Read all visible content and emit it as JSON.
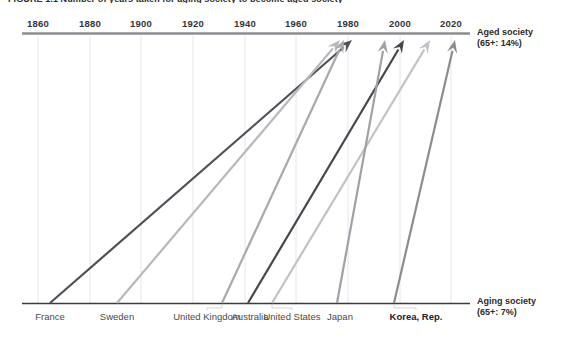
{
  "figure": {
    "title": "FIGURE 1.1 Number of years taken for aging society to become aged society"
  },
  "axis": {
    "top_label_line1": "Aged society",
    "top_label_line2": "(65+: 14%)",
    "bottom_label_line1": "Aging society",
    "bottom_label_line2": "(65+: 7%)",
    "ticks": [
      "1860",
      "1880",
      "1900",
      "1920",
      "1940",
      "1960",
      "1980",
      "2000",
      "2020"
    ],
    "tick_x": [
      38,
      90,
      141,
      193,
      245,
      296,
      348,
      400,
      451
    ]
  },
  "chart_data": {
    "type": "line",
    "title": "Number of years taken for aging society to become aged society",
    "xlabel": "Year",
    "ylabel": "Transition from aging society (65+: 7%) to aged society (65+: 14%)",
    "xlim": [
      1860,
      2030
    ],
    "grid": true,
    "legend": "none",
    "annotations": [
      "Aged society (65+: 14%)",
      "Aging society (65+: 7%)"
    ],
    "series": [
      {
        "name": "France",
        "label": "France",
        "aging_society_year": 1865,
        "aged_society_year": 1980,
        "years_taken": 115,
        "color": "#50505a",
        "x_start_px": 50,
        "x_end_px": 352,
        "label_x": 50,
        "bold": false
      },
      {
        "name": "Sweden",
        "label": "Sweden",
        "aging_society_year": 1890,
        "aged_society_year": 1975,
        "years_taken": 85,
        "color": "#b9b9bc",
        "x_start_px": 117,
        "x_end_px": 340,
        "label_x": 117,
        "bold": false
      },
      {
        "name": "United Kingdom",
        "label": "United Kingdom",
        "aging_society_year": 1930,
        "aged_society_year": 1976,
        "years_taken": 46,
        "color": "#a8a8ae",
        "x_start_px": 222,
        "x_end_px": 344,
        "label_x": 207,
        "bold": false
      },
      {
        "name": "Australia",
        "label": "Australia",
        "aging_society_year": 1939,
        "aged_society_year": 1999,
        "years_taken": 60,
        "color": "#46464e",
        "x_start_px": 248,
        "x_end_px": 404,
        "label_x": 250,
        "bold": false
      },
      {
        "name": "United States",
        "label": "United States",
        "aging_society_year": 1944,
        "aged_society_year": 2014,
        "years_taken": 70,
        "color": "#c2c2c6",
        "x_start_px": 272,
        "x_end_px": 430,
        "label_x": 292,
        "bold": false
      },
      {
        "name": "Japan",
        "label": "Japan",
        "aging_society_year": 1970,
        "aged_society_year": 1995,
        "years_taken": 25,
        "color": "#a0a0a6",
        "x_start_px": 337,
        "x_end_px": 385,
        "label_x": 340,
        "bold": false
      },
      {
        "name": "Korea, Rep.",
        "label": "Korea, Rep.",
        "aging_society_year": 2000,
        "aged_society_year": 2018,
        "years_taken": 18,
        "color": "#8c8c92",
        "x_start_px": 394,
        "x_end_px": 455,
        "label_x": 416,
        "bold": true
      }
    ]
  },
  "colors": {
    "axis_line": "#8c8c92",
    "baseline": "#3a3a40",
    "gridline": "#e6e6e9",
    "text": "#3c3c3c"
  }
}
